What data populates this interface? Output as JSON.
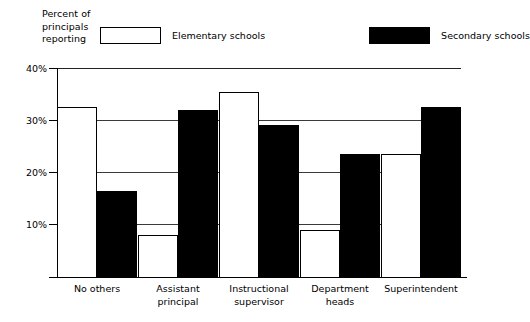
{
  "chart_data": {
    "type": "bar",
    "title": "",
    "axis_title": "Percent of\nprincipals\nreporting",
    "xlabel": "",
    "ylabel": "Percent of principals reporting",
    "ylim": [
      0,
      40
    ],
    "grid": true,
    "legend_position": "top",
    "ytick_labels": [
      "40%",
      "30%",
      "20%",
      "10%"
    ],
    "ytick_values": [
      40,
      30,
      20,
      10
    ],
    "categories": [
      "No others",
      "Assistant\nprincipal",
      "Instructional\nsupervisor",
      "Department\nheads",
      "Superintendent"
    ],
    "series": [
      {
        "name": "Elementary schools",
        "color": "#ffffff",
        "edge_color": "#000000",
        "values": [
          32.5,
          8,
          35.5,
          9,
          23.5
        ]
      },
      {
        "name": "Secondary schools",
        "color": "#000000",
        "edge_color": "#000000",
        "values": [
          16.5,
          32,
          29,
          23.5,
          32.5
        ]
      }
    ]
  },
  "legend": {
    "elementary_label": "Elementary schools",
    "secondary_label": "Secondary schools"
  },
  "axis": {
    "title": "Percent of\nprincipals\nreporting",
    "tick_40": "40%",
    "tick_30": "30%",
    "tick_20": "20%",
    "tick_10": "10%"
  },
  "categories": {
    "c0": "No others",
    "c1": "Assistant\nprincipal",
    "c2": "Instructional\nsupervisor",
    "c3": "Department\nheads",
    "c4": "Superintendent"
  }
}
